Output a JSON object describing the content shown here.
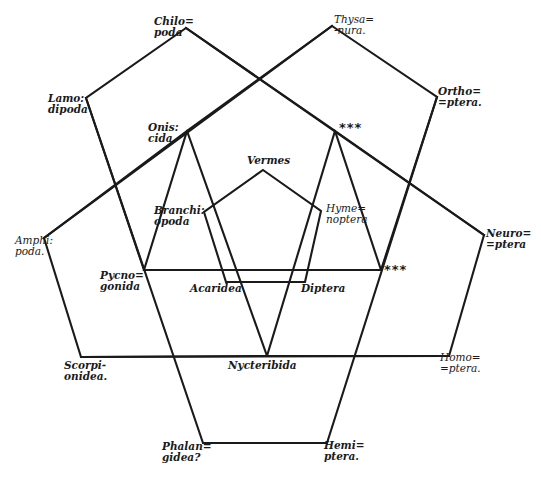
{
  "diagram": {
    "type": "pentagonal affinity diagram",
    "stroke_color": "#1a1a1a",
    "background": "#ffffff",
    "pentagons": [
      {
        "name": "upper-left",
        "points": "186,28 86,98 144,270 335,131 ..."
      },
      {
        "name": "upper-right",
        "points": "332,26 437,97 381,270 ..."
      }
    ],
    "labels": {
      "chilopoda": "Chilo=\npoda",
      "thysanura": "Thysa=\n-nura.",
      "lamodipoda": "Lamo:\ndipoda",
      "orthoptera": "Ortho=\n=ptera.",
      "oniscida": "Onis:\ncida",
      "vermes": "Vermes",
      "branchiopoda": "Branchi:\nopoda",
      "hymenoptera": "Hyme=\nnoptera",
      "amphipoda": "Amphi:\npoda.",
      "neuroptera": "Neuro=\n=ptera",
      "pycnogonida": "Pycno=\ngonida",
      "acaridea": "Acaridea",
      "diptera": "Diptera",
      "scorpionidea": "Scorpi-\nonidea.",
      "nycteribida": "Nycteribida",
      "homoptera": "Homo=\n=ptera.",
      "phalangidea": "Phalan=\ngidea?",
      "hemiptera": "Hemi=\nptera."
    },
    "unknown_markers": {
      "upper": "***",
      "right": "***"
    }
  }
}
